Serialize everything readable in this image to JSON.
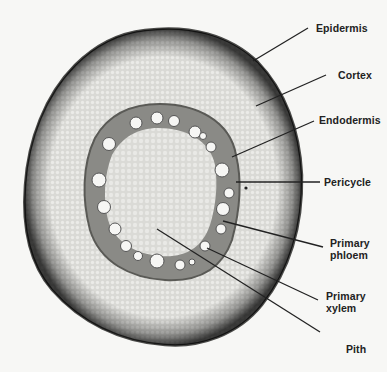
{
  "figure": {
    "background": "#f7f7f5",
    "colors": {
      "epidermis": "#3a3a3a",
      "cortex": "#d6d6d2",
      "vascular_ring": "#7c7c78",
      "pith": "#dcdcd8",
      "xylem_vessel": "#f8f8f6",
      "leader_line": "#222222"
    }
  },
  "labels": [
    {
      "id": "epidermis",
      "text": "Epidermis"
    },
    {
      "id": "cortex",
      "text": "Cortex"
    },
    {
      "id": "endodermis",
      "text": "Endodermis"
    },
    {
      "id": "pericycle",
      "text": "Pericycle"
    },
    {
      "id": "primary-phloem",
      "line1": "Primary",
      "line2": "phloem"
    },
    {
      "id": "primary-xylem",
      "line1": "Primary",
      "line2": "xylem"
    },
    {
      "id": "pith",
      "text": "Pith"
    }
  ]
}
